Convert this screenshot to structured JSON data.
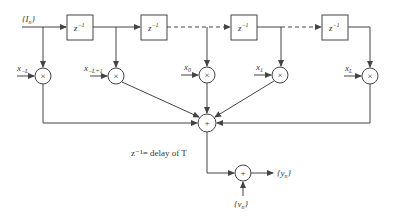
{
  "diagram": {
    "input_label": "{I",
    "input_sub": "n",
    "delay_label": "z",
    "delay_exp": "−1",
    "delay_boxes": [
      {
        "x": 67
      },
      {
        "x": 141
      },
      {
        "x": 231
      },
      {
        "x": 322
      }
    ],
    "taps": [
      {
        "label": "x",
        "sub": "−L",
        "cx": 43
      },
      {
        "label": "x",
        "sub": "−L+1",
        "cx": 116
      },
      {
        "label": "x",
        "sub": "0",
        "cx": 207
      },
      {
        "label": "x",
        "sub": "1",
        "cx": 280
      },
      {
        "label": "x",
        "sub": "L",
        "cx": 370
      }
    ],
    "multiplier_symbol": "×",
    "adder_symbol": "+",
    "caption": "z⁻¹= delay of T",
    "noise_label": "{v",
    "noise_sub": "n",
    "output_label": "{y",
    "output_sub": "n",
    "colors": {
      "stroke": "#444444",
      "background": "#ffffff"
    }
  }
}
